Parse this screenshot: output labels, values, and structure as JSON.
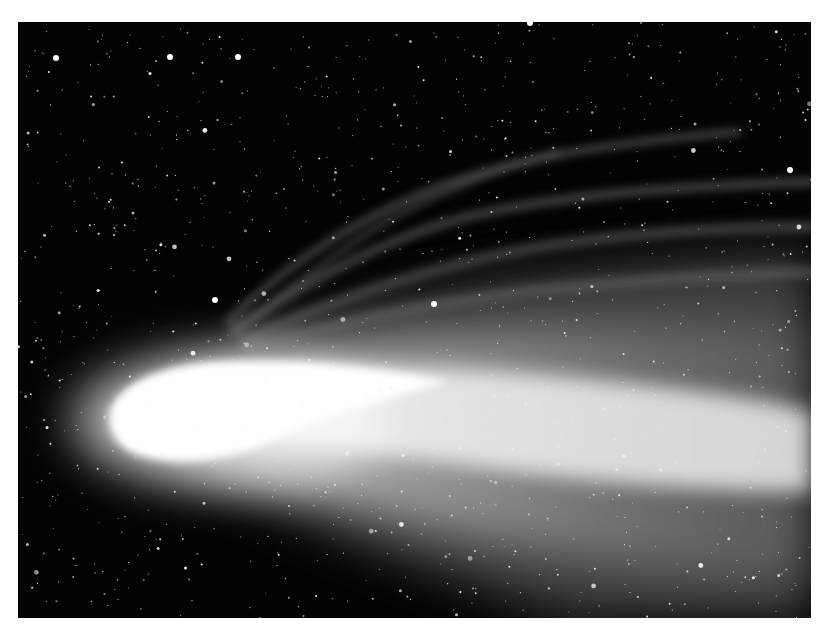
{
  "image": {
    "subject": "Comet with bright coma and broad dust tail against a dense starfield",
    "alt": "Long-exposure photograph of a bright comet, nucleus at left, tail fanning to the right",
    "colors": {
      "page_background": "#ffffff",
      "sky": "#030303",
      "coma_core": "#ffffff",
      "tail_glow": "#9a9a9a",
      "ion_streaks": "#5a5a5a",
      "star": "#f2f2f2"
    },
    "elements": [
      "starfield",
      "comet-coma",
      "dust-tail",
      "ion-tail-streaks"
    ]
  }
}
